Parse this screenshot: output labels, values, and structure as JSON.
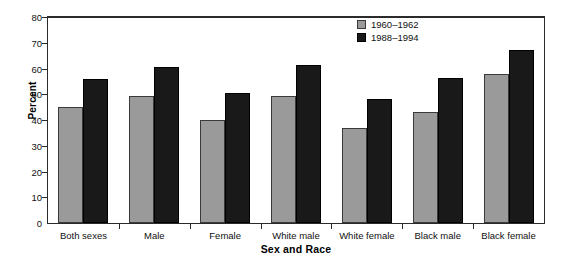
{
  "chart_data": {
    "type": "bar",
    "title": "",
    "xlabel": "Sex and Race",
    "ylabel": "Percent",
    "ylim": [
      0,
      80
    ],
    "yticks": [
      0,
      10,
      20,
      30,
      40,
      50,
      60,
      70,
      80
    ],
    "grid": false,
    "legend_position": "top-right",
    "categories": [
      "Both sexes",
      "Male",
      "Female",
      "White male",
      "White female",
      "Black male",
      "Black female"
    ],
    "series": [
      {
        "name": "1960–1962",
        "color": "#9a9a9a",
        "values": [
          45,
          49.5,
          40,
          49.5,
          37,
          43,
          58
        ]
      },
      {
        "name": "1988–1994",
        "color": "#191919",
        "values": [
          56,
          60.5,
          50.5,
          61.5,
          48,
          56.5,
          67
        ]
      }
    ]
  }
}
